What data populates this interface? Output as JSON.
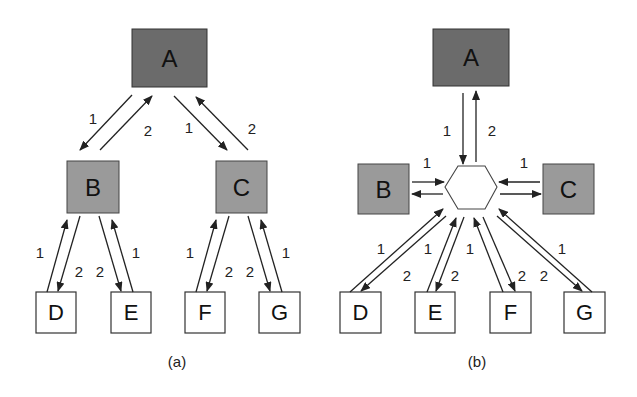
{
  "figure": {
    "panels": [
      {
        "caption": "(a)",
        "nodes": [
          {
            "id": "A",
            "label": "A",
            "shade": "dark"
          },
          {
            "id": "B",
            "label": "B",
            "shade": "mid"
          },
          {
            "id": "C",
            "label": "C",
            "shade": "mid"
          },
          {
            "id": "D",
            "label": "D",
            "shade": "light"
          },
          {
            "id": "E",
            "label": "E",
            "shade": "light"
          },
          {
            "id": "F",
            "label": "F",
            "shade": "light"
          },
          {
            "id": "G",
            "label": "G",
            "shade": "light"
          }
        ],
        "edges": [
          {
            "from": "A",
            "to": "B",
            "label": "1"
          },
          {
            "from": "B",
            "to": "A",
            "label": "2"
          },
          {
            "from": "A",
            "to": "C",
            "label": "1"
          },
          {
            "from": "C",
            "to": "A",
            "label": "2"
          },
          {
            "from": "D",
            "to": "B",
            "label": "1"
          },
          {
            "from": "B",
            "to": "D",
            "label": "2"
          },
          {
            "from": "B",
            "to": "E",
            "label": "2"
          },
          {
            "from": "E",
            "to": "B",
            "label": "1"
          },
          {
            "from": "F",
            "to": "C",
            "label": "1"
          },
          {
            "from": "C",
            "to": "F",
            "label": "2"
          },
          {
            "from": "C",
            "to": "G",
            "label": "2"
          },
          {
            "from": "G",
            "to": "C",
            "label": "1"
          }
        ]
      },
      {
        "caption": "(b)",
        "nodes": [
          {
            "id": "A",
            "label": "A",
            "shade": "dark"
          },
          {
            "id": "B",
            "label": "B",
            "shade": "mid"
          },
          {
            "id": "C",
            "label": "C",
            "shade": "mid"
          },
          {
            "id": "HUB",
            "label": "",
            "shape": "hexagon"
          },
          {
            "id": "D",
            "label": "D",
            "shade": "light"
          },
          {
            "id": "E",
            "label": "E",
            "shade": "light"
          },
          {
            "id": "F",
            "label": "F",
            "shade": "light"
          },
          {
            "id": "G",
            "label": "G",
            "shade": "light"
          }
        ],
        "edges": [
          {
            "from": "A",
            "to": "HUB",
            "label": "1"
          },
          {
            "from": "HUB",
            "to": "A",
            "label": "2"
          },
          {
            "from": "B",
            "to": "HUB",
            "label": "1"
          },
          {
            "from": "HUB",
            "to": "B",
            "label": ""
          },
          {
            "from": "C",
            "to": "HUB",
            "label": "1"
          },
          {
            "from": "HUB",
            "to": "C",
            "label": ""
          },
          {
            "from": "D",
            "to": "HUB",
            "label": "1"
          },
          {
            "from": "HUB",
            "to": "D",
            "label": "2"
          },
          {
            "from": "E",
            "to": "HUB",
            "label": "1"
          },
          {
            "from": "HUB",
            "to": "E",
            "label": "2"
          },
          {
            "from": "F",
            "to": "HUB",
            "label": "1"
          },
          {
            "from": "HUB",
            "to": "F",
            "label": "2"
          },
          {
            "from": "G",
            "to": "HUB",
            "label": "1"
          },
          {
            "from": "HUB",
            "to": "G",
            "label": "2"
          }
        ]
      }
    ],
    "colors": {
      "dark_node": "#6b6b6b",
      "mid_node": "#9a9a9a",
      "light_node": "#ffffff",
      "stroke": "#222222"
    }
  }
}
